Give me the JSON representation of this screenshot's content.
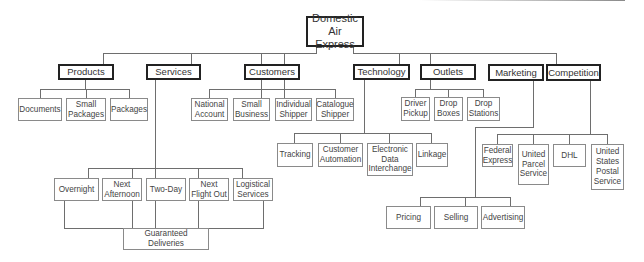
{
  "diagram": {
    "type": "org-chart",
    "root": {
      "label": "Domestic\nAir Express"
    },
    "categories": [
      {
        "id": "products",
        "label": "Products",
        "children": [
          "Documents",
          "Small\nPackages",
          "Packages"
        ]
      },
      {
        "id": "services",
        "label": "Services",
        "children": [
          "Overnight",
          "Next\nAfternoon",
          "Two-Day",
          "Next\nFlight Out",
          "Logistical\nServices"
        ],
        "merge_node": "Guaranteed\nDeliveries"
      },
      {
        "id": "customers",
        "label": "Customers",
        "children": [
          "National\nAccount",
          "Small\nBusiness",
          "Individual\nShipper",
          "Catalogue\nShipper"
        ]
      },
      {
        "id": "technology",
        "label": "Technology",
        "children": [
          "Tracking",
          "Customer\nAutomation",
          "Electronic\nData\nInterchange",
          "Linkage"
        ]
      },
      {
        "id": "outlets",
        "label": "Outlets",
        "children": [
          "Driver\nPickup",
          "Drop\nBoxes",
          "Drop\nStations"
        ]
      },
      {
        "id": "marketing",
        "label": "Marketing",
        "children": [
          "Pricing",
          "Selling",
          "Advertising"
        ]
      },
      {
        "id": "competition",
        "label": "Competition",
        "children": [
          "Federal\nExpress",
          "United\nParcel\nService",
          "DHL",
          "United\nStates\nPostal\nService"
        ]
      }
    ]
  },
  "colors": {
    "thick_border": "#222222",
    "thin_border": "#8a8a8a",
    "connector": "#6e6e6e",
    "background": "#ffffff"
  }
}
